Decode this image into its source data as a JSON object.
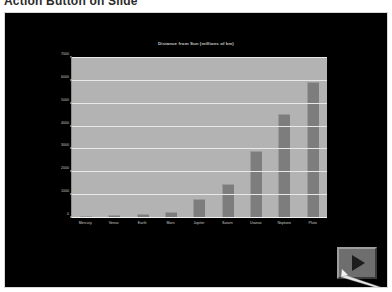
{
  "caption": "Action Button on Slide",
  "slide": {
    "background_color": "#000000",
    "border_color": "#d8d8d8"
  },
  "action_button": {
    "name": "action-button-forward",
    "icon": "play-triangle-icon",
    "cursor": "arrow-cursor",
    "fill_color": "#6e6e6e",
    "glyph_color": "#1d1d1d"
  },
  "chart_data": {
    "type": "bar",
    "title": "Distance from Sun (millions of km)",
    "xlabel": "",
    "ylabel": "",
    "ylim": [
      0,
      7000
    ],
    "grid": true,
    "legend": "none",
    "bar_color": "#7d7d7d",
    "plot_background": "#b3b3b3",
    "gridline_color": "#e8e8e8",
    "text_color": "#cfcfcf",
    "categories": [
      "Mercury",
      "Venus",
      "Earth",
      "Mars",
      "Jupiter",
      "Saturn",
      "Uranus",
      "Neptune",
      "Pluto"
    ],
    "values": [
      58,
      108,
      150,
      228,
      778,
      1427,
      2871,
      4497,
      5913
    ],
    "yticks": [
      0,
      1000,
      2000,
      3000,
      4000,
      5000,
      6000,
      7000
    ]
  }
}
